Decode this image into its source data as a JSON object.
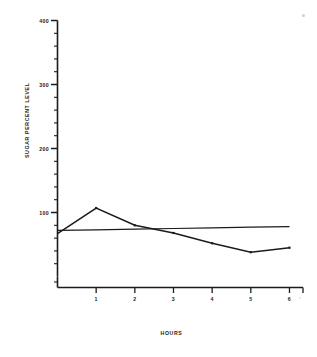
{
  "chart_data": {
    "type": "line",
    "title": "",
    "xlabel": "HOURS",
    "ylabel": "SUGAR PERCENT LEVEL",
    "xlim": [
      0,
      6.35
    ],
    "ylim": [
      0,
      400
    ],
    "grid": false,
    "legend": "none",
    "x_ticks": [
      "1",
      "2",
      "3",
      "4",
      "5",
      "6"
    ],
    "x_tick_values": [
      1,
      2,
      3,
      4,
      5,
      6
    ],
    "y_ticks": [
      "100",
      "200",
      "300",
      "400"
    ],
    "y_tick_values": [
      100,
      200,
      300,
      400
    ],
    "y_minor_step": 20,
    "x": [
      0,
      1,
      2,
      3,
      4,
      5,
      6
    ],
    "series": [
      {
        "name": "sugar percent level",
        "values": [
          67,
          107,
          80,
          68,
          52,
          38,
          45
        ],
        "markers": true
      },
      {
        "name": "reference line",
        "values": [
          72,
          73,
          74,
          75,
          76,
          77,
          78
        ],
        "markers": false
      }
    ]
  },
  "axes": {
    "x_title": "HOURS",
    "y_title": "SUGAR PERCENT LEVEL"
  }
}
